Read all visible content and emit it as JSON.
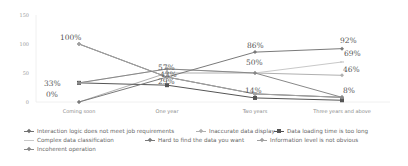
{
  "chart_data": {
    "type": "line",
    "title": "",
    "xlabel": "",
    "ylabel": "",
    "ylim": [
      0,
      150
    ],
    "yticks": [
      0,
      50,
      100,
      150
    ],
    "ytick_labels": [
      "0",
      "50",
      "100",
      "150"
    ],
    "grid": false,
    "legend_position": "bottom",
    "categories": [
      "Coming soon",
      "One year",
      "Two years",
      "Three years and above"
    ],
    "series": [
      {
        "name": "Interaction logic does not meet job requirements",
        "values": [
          100,
          43,
          14,
          8
        ],
        "color": "#707070",
        "marker": "diamond"
      },
      {
        "name": "Inaccurate data display",
        "values": [
          0,
          50,
          50,
          46
        ],
        "color": "#b0b0b0",
        "marker": "diamond"
      },
      {
        "name": "Data loading time is too long",
        "values": [
          33,
          29,
          7,
          3
        ],
        "color": "#555555",
        "marker": "square"
      },
      {
        "name": "Complex data classification",
        "values": [
          33,
          57,
          50,
          69
        ],
        "color": "#c8c8c8",
        "marker": "dash"
      },
      {
        "name": "Hard to find the data you want",
        "values": [
          0,
          43,
          86,
          92
        ],
        "color": "#7a7a7a",
        "marker": "diamond"
      },
      {
        "name": "Information level is not obvious",
        "values": [
          100,
          43,
          14,
          8
        ],
        "color": "#a0a0a0",
        "marker": "diamond"
      },
      {
        "name": "Incoherent operation",
        "values": [
          33,
          57,
          50,
          8
        ],
        "color": "#888888",
        "marker": "diamond"
      }
    ],
    "data_labels": [
      {
        "category": "Coming soon",
        "text": "100%"
      },
      {
        "category": "Coming soon",
        "text": "33%"
      },
      {
        "category": "Coming soon",
        "text": "0%"
      },
      {
        "category": "One year",
        "text": "57%"
      },
      {
        "category": "One year",
        "text": "43%"
      },
      {
        "category": "One year",
        "text": "29%"
      },
      {
        "category": "Two years",
        "text": "86%"
      },
      {
        "category": "Two years",
        "text": "50%"
      },
      {
        "category": "Two years",
        "text": "14%"
      },
      {
        "category": "Three years and above",
        "text": "92%"
      },
      {
        "category": "Three years and above",
        "text": "69%"
      },
      {
        "category": "Three years and above",
        "text": "46%"
      },
      {
        "category": "Three years and above",
        "text": "8%"
      }
    ]
  },
  "legend": {
    "items": [
      "Interaction logic does not meet job requirements",
      "Inaccurate data display",
      "Data loading time is too long",
      "Complex data classification",
      "Hard to find the data you want",
      "Information level is not obvious",
      "Incoherent operation"
    ]
  }
}
